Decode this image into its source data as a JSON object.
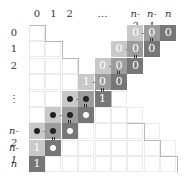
{
  "diagram": {
    "col_labels": [
      {
        "col": 0,
        "text": "0",
        "italic": false
      },
      {
        "col": 1,
        "text": "1",
        "italic": false
      },
      {
        "col": 2,
        "text": "2",
        "italic": false
      },
      {
        "col": 4,
        "text": "…",
        "italic": false
      },
      {
        "col": 6,
        "text": "n-2",
        "italic": true
      },
      {
        "col": 7,
        "text": "n-1",
        "italic": true
      },
      {
        "col": 8,
        "text": "n",
        "italic": true
      }
    ],
    "row_labels": [
      {
        "row": 0,
        "text": "0",
        "italic": false
      },
      {
        "row": 1,
        "text": "1",
        "italic": false
      },
      {
        "row": 2,
        "text": "2",
        "italic": false
      },
      {
        "row": 4,
        "text": "⋮",
        "italic": false
      },
      {
        "row": 6,
        "text": "n-2",
        "italic": true
      },
      {
        "row": 7,
        "text": "n-1",
        "italic": true
      },
      {
        "row": 8,
        "text": "n",
        "italic": true
      }
    ],
    "colors": {
      "light": "#c9c9c9",
      "mid": "#9c9c9c",
      "dark": "#777777"
    },
    "rows": [
      {
        "row": 0,
        "light": {
          "col": 6,
          "value": "0"
        },
        "mid": {
          "col": 7,
          "value": "0"
        },
        "dark": {
          "col": 8,
          "value": "0"
        }
      },
      {
        "row": 1,
        "light": {
          "col": 5,
          "value": "0"
        },
        "mid": {
          "col": 6,
          "value": "0"
        },
        "dark": {
          "col": 7,
          "value": "0"
        }
      },
      {
        "row": 2,
        "light": {
          "col": 4,
          "value": "0"
        },
        "mid": {
          "col": 5,
          "value": "0"
        },
        "dark": {
          "col": 6,
          "value": "0"
        }
      },
      {
        "row": 3,
        "light": {
          "col": 3,
          "value": "1"
        },
        "mid": {
          "col": 4,
          "value": "0"
        },
        "dark": {
          "col": 5,
          "value": "0"
        }
      },
      {
        "row": 4,
        "light": {
          "col": 2,
          "value": "●"
        },
        "mid": {
          "col": 3,
          "value": "●"
        },
        "dark": {
          "col": 4,
          "value": "1"
        }
      },
      {
        "row": 5,
        "light": {
          "col": 1,
          "value": "●"
        },
        "mid": {
          "col": 2,
          "value": "●"
        },
        "dark": {
          "col": 3,
          "value": "○"
        }
      },
      {
        "row": 6,
        "light": {
          "col": 0,
          "value": "●"
        },
        "mid": {
          "col": 1,
          "value": "●"
        },
        "dark": {
          "col": 2,
          "value": "○"
        }
      },
      {
        "row": 7,
        "light": {
          "col": 0,
          "value": "1"
        },
        "mid": null,
        "dark": {
          "col": 1,
          "value": "○"
        }
      },
      {
        "row": 8,
        "light": null,
        "mid": null,
        "dark": {
          "col": 0,
          "value": "1"
        }
      }
    ],
    "operator_plus": "+",
    "operator_equals": "="
  }
}
